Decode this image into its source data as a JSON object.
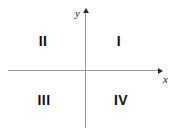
{
  "figure": {
    "background_color": "#ffffff",
    "axis_color": "#9a9a9a",
    "arrow_color": "#2b2b2b",
    "label_color": "#111111"
  },
  "axes": {
    "x_label": "x",
    "y_label": "y",
    "x_arrow_icon": "arrow-right-icon",
    "y_arrow_icon": "arrow-up-icon"
  },
  "quadrants": [
    {
      "numeral": "I",
      "position": "top-right"
    },
    {
      "numeral": "II",
      "position": "top-left"
    },
    {
      "numeral": "III",
      "position": "bottom-left"
    },
    {
      "numeral": "IV",
      "position": "bottom-right"
    }
  ],
  "chart_data": {
    "type": "scatter",
    "title": "",
    "xlabel": "x",
    "ylabel": "y",
    "grid": false,
    "legend": "none",
    "xlim": [
      -1,
      1
    ],
    "ylim": [
      -1,
      1
    ],
    "annotations": [
      {
        "text": "I",
        "x": 0.45,
        "y": 0.5
      },
      {
        "text": "II",
        "x": -0.55,
        "y": 0.5
      },
      {
        "text": "III",
        "x": -0.55,
        "y": -0.5
      },
      {
        "text": "IV",
        "x": 0.45,
        "y": -0.5
      }
    ],
    "series": []
  }
}
